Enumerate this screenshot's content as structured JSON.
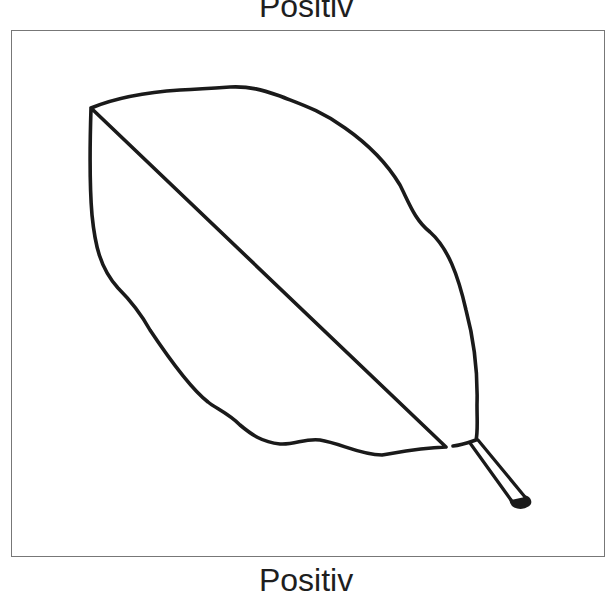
{
  "figure": {
    "title_top": "Positiv",
    "title_bottom": "Positiv",
    "stroke_color": "#1a1a1a",
    "frame_color": "#777777",
    "background": "#ffffff"
  }
}
